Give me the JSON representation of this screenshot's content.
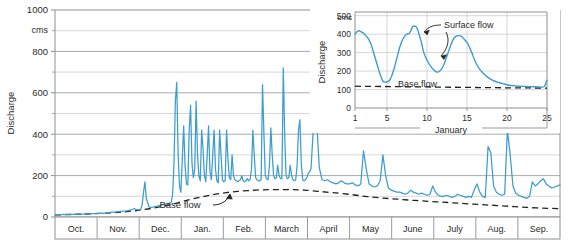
{
  "figure": {
    "background": "#ffffff",
    "line_color": "#3d9cd0",
    "baseflow_color": "#23201d",
    "grid_color": "#b9bcbe",
    "frame_color": "#8d9094",
    "text_color": "#2b2b2b"
  },
  "chart_data": [
    {
      "id": "main",
      "type": "line",
      "title": "",
      "xlabel": "",
      "ylabel": "Discharge",
      "yunit": "cms",
      "ylim": [
        0,
        1000
      ],
      "yticks": [
        0,
        200,
        400,
        600,
        800,
        1000
      ],
      "ytick_labels": [
        "0",
        "200",
        "400",
        "600",
        "800",
        "1000"
      ],
      "minor_gridline_step": 100,
      "grid": true,
      "legend": "none",
      "categories": [
        "Oct.",
        "Nov.",
        "Dec.",
        "Jan.",
        "Feb.",
        "March",
        "April",
        "May",
        "June",
        "July",
        "Aug.",
        "Sep."
      ],
      "xlim": [
        0,
        365
      ],
      "annotations": [
        {
          "text": "Base flow",
          "x_day": 160,
          "y_value": 20,
          "arrow_to_x_day": 183,
          "arrow_to_y_value": 95
        }
      ],
      "series": [
        {
          "name": "Discharge",
          "color": "#3d9cd0",
          "style": "solid",
          "x": [
            0,
            4,
            8,
            12,
            16,
            20,
            24,
            28,
            31,
            34,
            37,
            40,
            43,
            46,
            49,
            52,
            55,
            57,
            59,
            61,
            62,
            63,
            64,
            65,
            66,
            68,
            70,
            72,
            74,
            76,
            78,
            80,
            82,
            84,
            85,
            86,
            87,
            88,
            89,
            90,
            91,
            92,
            93,
            94,
            95,
            96,
            97,
            98,
            99,
            100,
            101,
            102,
            103,
            104,
            105,
            106,
            107,
            108,
            109,
            110,
            111,
            112,
            113,
            114,
            115,
            116,
            117,
            118,
            119,
            120,
            121,
            122,
            123,
            124,
            125,
            126,
            127,
            128,
            129,
            130,
            131,
            132,
            133,
            134,
            135,
            136,
            137,
            138,
            139,
            140,
            141,
            142,
            143,
            144,
            145,
            146,
            147,
            148,
            149,
            150,
            151,
            152,
            153,
            154,
            155,
            156,
            157,
            158,
            159,
            160,
            161,
            162,
            163,
            164,
            165,
            166,
            167,
            168,
            169,
            170,
            171,
            172,
            173,
            174,
            175,
            176,
            177,
            178,
            179,
            180,
            181,
            182,
            183,
            185,
            187,
            189,
            191,
            193,
            195,
            197,
            199,
            201,
            203,
            205,
            207,
            209,
            211,
            213,
            215,
            217,
            219,
            221,
            223,
            225,
            227,
            229,
            231,
            233,
            235,
            237,
            239,
            241,
            243,
            245,
            247,
            249,
            251,
            253,
            255,
            257,
            259,
            261,
            263,
            265,
            267,
            269,
            271,
            273,
            275,
            277,
            279,
            281,
            283,
            285,
            287,
            289,
            291,
            293,
            295,
            297,
            299,
            301,
            303,
            305,
            307,
            309,
            311,
            313,
            315,
            317,
            319,
            321,
            323,
            325,
            327,
            329,
            331,
            333,
            335,
            337,
            339,
            341,
            343,
            345,
            347,
            349,
            351,
            353,
            355,
            357,
            359,
            361,
            365
          ],
          "y": [
            12,
            12,
            13,
            13,
            14,
            14,
            15,
            16,
            17,
            18,
            20,
            22,
            24,
            26,
            28,
            30,
            34,
            40,
            36,
            34,
            38,
            60,
            120,
            170,
            90,
            48,
            46,
            50,
            52,
            56,
            60,
            62,
            66,
            70,
            110,
            260,
            560,
            650,
            300,
            150,
            120,
            280,
            440,
            250,
            160,
            155,
            420,
            540,
            260,
            190,
            230,
            560,
            300,
            200,
            175,
            420,
            330,
            200,
            170,
            300,
            440,
            220,
            180,
            300,
            420,
            230,
            175,
            165,
            420,
            300,
            180,
            170,
            175,
            420,
            280,
            190,
            180,
            300,
            200,
            180,
            175,
            170,
            175,
            180,
            200,
            175,
            170,
            175,
            185,
            175,
            180,
            230,
            420,
            300,
            190,
            180,
            175,
            175,
            180,
            640,
            400,
            200,
            185,
            180,
            250,
            430,
            300,
            200,
            185,
            190,
            250,
            200,
            185,
            185,
            720,
            400,
            200,
            185,
            190,
            250,
            200,
            180,
            175,
            180,
            250,
            420,
            470,
            260,
            180,
            175,
            180,
            190,
            210,
            230,
            460,
            480,
            240,
            180,
            175,
            180,
            170,
            165,
            160,
            165,
            175,
            165,
            160,
            160,
            165,
            155,
            150,
            160,
            320,
            230,
            160,
            150,
            145,
            150,
            175,
            300,
            200,
            140,
            130,
            125,
            120,
            120,
            115,
            110,
            115,
            130,
            120,
            115,
            110,
            115,
            110,
            105,
            110,
            150,
            120,
            105,
            100,
            100,
            105,
            100,
            95,
            100,
            110,
            105,
            100,
            95,
            100,
            95,
            130,
            160,
            120,
            100,
            95,
            340,
            310,
            150,
            120,
            110,
            105,
            110,
            420,
            300,
            150,
            115,
            105,
            100,
            95,
            90,
            100,
            170,
            150,
            160,
            175,
            185,
            160,
            150,
            140,
            145,
            155,
            160,
            145,
            150,
            170,
            260,
            300,
            170,
            120,
            110,
            105,
            100,
            95,
            90,
            85,
            80,
            75,
            70,
            65,
            60,
            60,
            60,
            58,
            55,
            55,
            300,
            320,
            180,
            90,
            80,
            75,
            72,
            70,
            70,
            72,
            70
          ]
        },
        {
          "name": "Base flow",
          "color": "#23201d",
          "style": "dashed",
          "x": [
            0,
            20,
            40,
            55,
            62,
            70,
            78,
            85,
            92,
            100,
            108,
            116,
            124,
            132,
            140,
            148,
            156,
            164,
            172,
            180,
            190,
            200,
            212,
            224,
            236,
            248,
            260,
            272,
            284,
            296,
            308,
            320,
            332,
            344,
            356,
            365
          ],
          "y": [
            10,
            14,
            20,
            28,
            34,
            42,
            52,
            62,
            75,
            88,
            100,
            110,
            118,
            124,
            128,
            131,
            132,
            132,
            132,
            130,
            124,
            118,
            110,
            100,
            92,
            86,
            80,
            75,
            70,
            65,
            60,
            55,
            50,
            45,
            42,
            40
          ]
        }
      ]
    },
    {
      "id": "inset",
      "type": "line",
      "title": "",
      "xlabel": "January",
      "ylabel": "Discharge",
      "yunit": "cms",
      "ylim": [
        0,
        520
      ],
      "yticks": [
        0,
        100,
        200,
        300,
        400,
        500
      ],
      "ytick_labels": [
        "0",
        "100",
        "200",
        "300",
        "400",
        "500"
      ],
      "xlim": [
        1,
        25
      ],
      "xticks": [
        1,
        5,
        10,
        15,
        20,
        25
      ],
      "xtick_labels": [
        "1",
        "5",
        "10",
        "15",
        "20",
        "25"
      ],
      "grid": true,
      "legend": "none",
      "annotations": [
        {
          "text": "Surface flow",
          "x_day": 11.6,
          "y_value": 480,
          "arrows": 2
        },
        {
          "text": "Base flow",
          "x_day": 8.2,
          "y_value": 170
        }
      ],
      "series": [
        {
          "name": "Discharge",
          "color": "#3d9cd0",
          "style": "solid",
          "x": [
            1,
            1.4,
            1.8,
            2.2,
            2.6,
            3,
            3.4,
            3.8,
            4.2,
            4.5,
            4.8,
            5.1,
            5.4,
            5.8,
            6.2,
            6.6,
            7,
            7.4,
            7.8,
            8,
            8.2,
            8.5,
            8.8,
            9,
            9.3,
            9.6,
            10,
            10.4,
            10.8,
            11.2,
            11.6,
            12,
            12.4,
            12.8,
            13.2,
            13.6,
            14,
            14.3,
            14.6,
            15,
            15.3,
            15.6,
            16,
            16.5,
            17,
            17.5,
            18,
            18.5,
            19,
            19.5,
            20,
            20.5,
            21,
            21.5,
            22,
            23,
            24,
            24.4,
            24.7,
            25
          ],
          "y": [
            400,
            418,
            412,
            400,
            380,
            345,
            290,
            230,
            175,
            145,
            140,
            143,
            155,
            200,
            265,
            330,
            375,
            398,
            405,
            420,
            440,
            443,
            428,
            400,
            355,
            300,
            260,
            230,
            208,
            195,
            200,
            225,
            270,
            320,
            365,
            388,
            392,
            388,
            375,
            355,
            330,
            300,
            255,
            215,
            190,
            170,
            155,
            145,
            138,
            132,
            126,
            122,
            120,
            118,
            117,
            116,
            114,
            113,
            118,
            150
          ]
        },
        {
          "name": "Base flow",
          "color": "#23201d",
          "style": "dashed",
          "x": [
            1,
            10,
            18,
            25
          ],
          "y": [
            118,
            114,
            110,
            108
          ]
        }
      ]
    }
  ],
  "labels": {
    "main_y_title": "Discharge",
    "main_y_unit": "cms",
    "main_y_ticks": [
      "1000",
      "800",
      "600",
      "400",
      "200",
      "0"
    ],
    "months": [
      "Oct.",
      "Nov.",
      "Dec.",
      "Jan.",
      "Feb.",
      "March",
      "April",
      "May",
      "June",
      "July",
      "Aug.",
      "Sep."
    ],
    "main_baseflow_annotation": "Base flow",
    "inset_y_title": "Discharge",
    "inset_y_unit": "cms",
    "inset_y_ticks": [
      "500",
      "400",
      "300",
      "200",
      "100",
      "0"
    ],
    "inset_x_ticks": [
      "1",
      "5",
      "10",
      "15",
      "20",
      "25"
    ],
    "inset_x_title": "January",
    "inset_surface_annotation": "Surface flow",
    "inset_baseflow_annotation": "Base flow"
  }
}
